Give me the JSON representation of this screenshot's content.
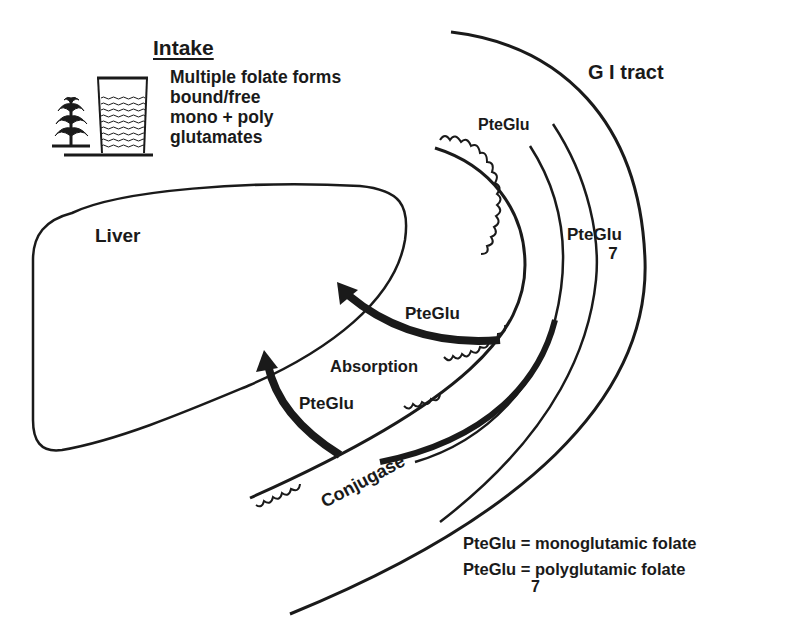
{
  "intake": {
    "title": "Intake",
    "lines": [
      "Multiple folate forms",
      "bound/free",
      "mono + poly",
      "glutamates"
    ],
    "icons": [
      "corn-plant-icon",
      "glass-of-liquid-icon"
    ]
  },
  "regions": {
    "gi_tract": "G I tract",
    "liver": "Liver"
  },
  "labels": {
    "pteglu_top": "PteGlu",
    "pteglu7_main": "PteGlu",
    "pteglu7_sub": "7",
    "pteglu_mid": "PteGlu",
    "absorption": "Absorption",
    "pteglu_low": "PteGlu",
    "conjugase": "Conjugase"
  },
  "legend": {
    "rows": [
      {
        "term": "PteGlu",
        "subscript": "",
        "eq": "=",
        "definition": "monoglutamic folate"
      },
      {
        "term": "PteGlu",
        "subscript": "7",
        "eq": "=",
        "definition": "polyglutamic folate"
      }
    ]
  },
  "colors": {
    "ink": "#1a1a1a",
    "background": "#ffffff"
  }
}
